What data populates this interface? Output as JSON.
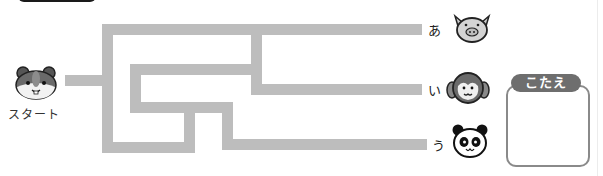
{
  "start": {
    "label": "スタート",
    "icon": "hamster-icon"
  },
  "goals": [
    {
      "label": "あ",
      "icon": "pig-icon"
    },
    {
      "label": "い",
      "icon": "monkey-icon"
    },
    {
      "label": "う",
      "icon": "panda-icon"
    }
  ],
  "answer": {
    "tag": "こたえ",
    "value": ""
  },
  "colors": {
    "path": "#bdbdbd",
    "tag_bg": "#6e6e6e",
    "box_border": "#8a8a8a"
  }
}
